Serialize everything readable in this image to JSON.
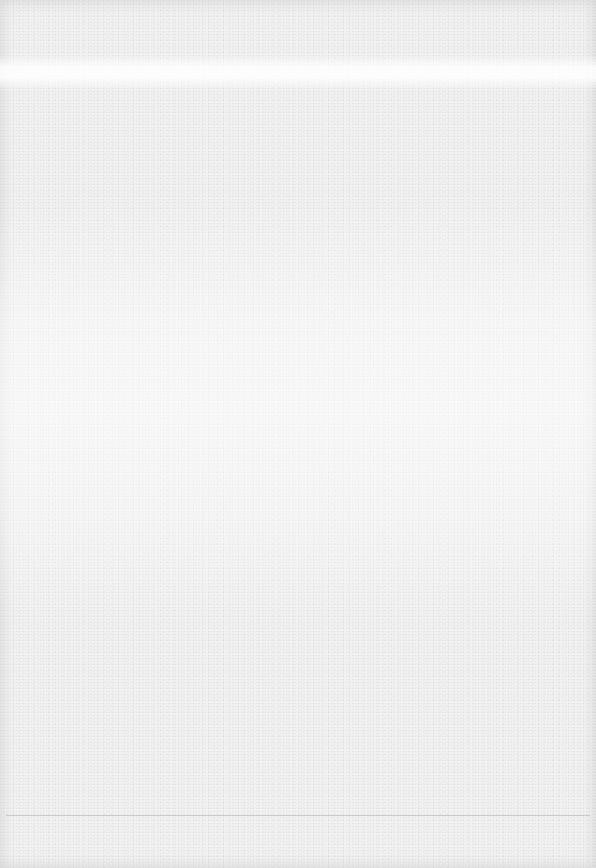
{
  "page": {
    "type": "blank-scanned-page",
    "background_color": "#f1f1f1",
    "rule_color": "#bdbdbd",
    "text": ""
  }
}
